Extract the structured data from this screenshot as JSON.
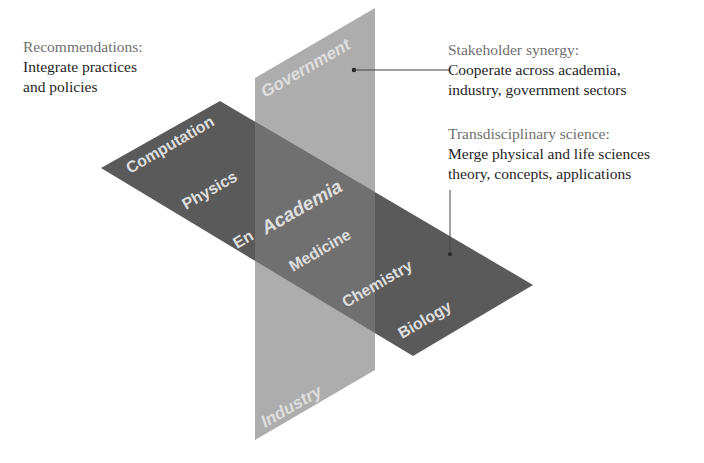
{
  "diagram": {
    "planes": {
      "vertical": {
        "label_top": "Government",
        "label_bottom": "Industry",
        "center_label": "Academia",
        "color": "#a9a9a9"
      },
      "horizontal": {
        "color": "#5a5a5a",
        "overlap_color": "#6e6e6e",
        "disciplines": [
          "Computation",
          "Physics",
          "Engineering",
          "Medicine",
          "Chemistry",
          "Biology"
        ],
        "visible_partial_label": "En"
      }
    },
    "annotations": {
      "recommendations": {
        "heading": "Recommendations:",
        "lines": [
          "Integrate practices",
          "and policies"
        ]
      },
      "stakeholder_synergy": {
        "heading": "Stakeholder synergy:",
        "lines": [
          "Cooperate across academia,",
          "industry, government sectors"
        ]
      },
      "transdisciplinary_science": {
        "heading": "Transdisciplinary science:",
        "lines": [
          "Merge physical and life sciences",
          "theory, concepts, applications"
        ]
      }
    }
  }
}
